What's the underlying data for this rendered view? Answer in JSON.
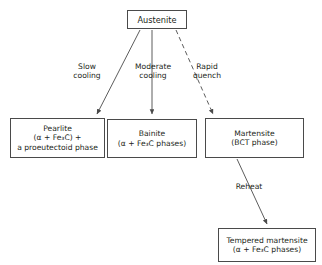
{
  "diagram": {
    "type": "flowchart",
    "background_color": "#ffffff",
    "line_color": "#4a4a4a",
    "text_color": "#231f20"
  },
  "nodes": {
    "austenite": {
      "lines": [
        "Austenite"
      ]
    },
    "pearlite": {
      "lines": [
        "Pearlite",
        "(α + Fe₃C) +",
        "a proeutectoid phase"
      ]
    },
    "bainite": {
      "lines": [
        "Bainite",
        "(α + Fe₃C phases)"
      ]
    },
    "martensite": {
      "lines": [
        "Martensite",
        "(BCT phase)"
      ]
    },
    "tempered": {
      "lines": [
        "Tempered martensite",
        "(α + Fe₃C phases)"
      ]
    }
  },
  "edge_labels": {
    "slow": {
      "lines": [
        "Slow",
        "cooling"
      ]
    },
    "moderate": {
      "lines": [
        "Moderate",
        "cooling"
      ]
    },
    "rapid": {
      "lines": [
        "Rapid",
        "quench"
      ]
    },
    "reheat": {
      "lines": [
        "Reheat"
      ]
    }
  },
  "edges": [
    {
      "from": "austenite",
      "to": "pearlite",
      "label": "slow",
      "style": "solid"
    },
    {
      "from": "austenite",
      "to": "bainite",
      "label": "moderate",
      "style": "solid"
    },
    {
      "from": "austenite",
      "to": "martensite",
      "label": "rapid",
      "style": "dashed"
    },
    {
      "from": "martensite",
      "to": "tempered",
      "label": "reheat",
      "style": "solid"
    }
  ]
}
